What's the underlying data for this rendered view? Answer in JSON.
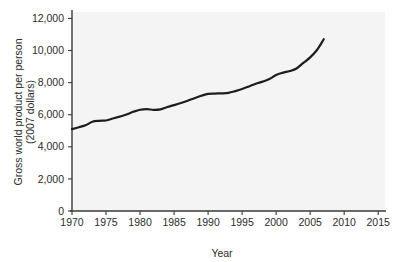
{
  "chart_data": {
    "type": "line",
    "title": "",
    "xlabel": "Year",
    "ylabel": "Gross world product per person (2007 dollars)",
    "ylabel_line1": "Gross world product per person",
    "ylabel_line2": "(2007 dollars)",
    "xlim": [
      1970,
      2016
    ],
    "ylim": [
      0,
      12400
    ],
    "xticks": [
      1970,
      1975,
      1980,
      1985,
      1990,
      1995,
      2000,
      2005,
      2010,
      2015
    ],
    "xtick_labels": [
      "1970",
      "1975",
      "1980",
      "1985",
      "1990",
      "1995",
      "2000",
      "2005",
      "2010",
      "2015"
    ],
    "yticks": [
      0,
      2000,
      4000,
      6000,
      8000,
      10000,
      12000
    ],
    "ytick_labels": [
      "0",
      "2,000",
      "4,000",
      "6,000",
      "8,000",
      "10,000",
      "12,000"
    ],
    "grid": false,
    "legend": null,
    "series": [
      {
        "name": "Gross world product per person",
        "color": "#1d1d1d",
        "x": [
          1970,
          1971,
          1972,
          1973,
          1974,
          1975,
          1976,
          1977,
          1978,
          1979,
          1980,
          1981,
          1982,
          1983,
          1984,
          1985,
          1986,
          1987,
          1988,
          1989,
          1990,
          1991,
          1992,
          1993,
          1994,
          1995,
          1996,
          1997,
          1998,
          1999,
          2000,
          2001,
          2002,
          2003,
          2004,
          2005,
          2006,
          2007
        ],
        "values": [
          5100,
          5220,
          5340,
          5560,
          5620,
          5640,
          5760,
          5880,
          6010,
          6180,
          6310,
          6350,
          6300,
          6330,
          6480,
          6600,
          6730,
          6870,
          7030,
          7180,
          7300,
          7320,
          7330,
          7360,
          7470,
          7600,
          7760,
          7930,
          8060,
          8220,
          8480,
          8620,
          8720,
          8880,
          9230,
          9570,
          10030,
          10700
        ]
      }
    ]
  },
  "axis_colors": {
    "axis": "#3a3a3a",
    "line": "#1d1d1d",
    "plot_background": "#f4f4f4",
    "figure_background": "#ffffff"
  }
}
